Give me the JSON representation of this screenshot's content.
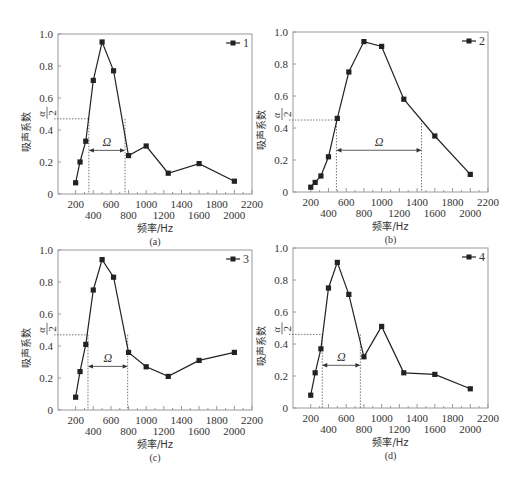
{
  "chart_data": [
    {
      "type": "line",
      "panel": "(a)",
      "legend": "1",
      "xlabel": "频率/Hz",
      "ylabel": "吸声系数",
      "xlim": [
        0,
        2200
      ],
      "ylim": [
        0,
        1.0
      ],
      "xticks_top_row": [
        "200",
        "600",
        "1000",
        "1400",
        "1800",
        "2200"
      ],
      "xticks_bottom_row": [
        "400",
        "800",
        "1200",
        "1600",
        "2000"
      ],
      "yticks": [
        "0",
        "0.2",
        "0.4",
        "0.6",
        "0.8",
        "1.0"
      ],
      "x": [
        200,
        250,
        315,
        400,
        500,
        630,
        800,
        1000,
        1250,
        1600,
        2000
      ],
      "values": [
        0.07,
        0.2,
        0.33,
        0.71,
        0.95,
        0.77,
        0.24,
        0.3,
        0.13,
        0.19,
        0.08
      ],
      "half_max_label": "α/2",
      "half_max_value": 0.47,
      "bandwidth_label": "Ω",
      "bandwidth_range": [
        350,
        760
      ],
      "grid": false,
      "legend_position": "top-right"
    },
    {
      "type": "line",
      "panel": "(b)",
      "legend": "2",
      "xlabel": "频率/Hz",
      "ylabel": "吸声系数",
      "xlim": [
        0,
        2200
      ],
      "ylim": [
        0,
        1.0
      ],
      "xticks_top_row": [
        "200",
        "600",
        "1000",
        "1400",
        "1800",
        "2200"
      ],
      "xticks_bottom_row": [
        "400",
        "800",
        "1200",
        "1600",
        "2000"
      ],
      "yticks": [
        "0",
        "0.2",
        "0.4",
        "0.6",
        "0.8",
        "1.0"
      ],
      "x": [
        200,
        250,
        315,
        400,
        500,
        630,
        800,
        1000,
        1250,
        1600,
        2000
      ],
      "values": [
        0.03,
        0.06,
        0.1,
        0.22,
        0.46,
        0.75,
        0.94,
        0.91,
        0.58,
        0.35,
        0.11
      ],
      "half_max_label": "α/2",
      "half_max_value": 0.45,
      "bandwidth_label": "Ω",
      "bandwidth_range": [
        490,
        1450
      ],
      "grid": false,
      "legend_position": "top-right"
    },
    {
      "type": "line",
      "panel": "(c)",
      "legend": "3",
      "xlabel": "频率/Hz",
      "ylabel": "吸声系数",
      "xlim": [
        0,
        2200
      ],
      "ylim": [
        0,
        1.0
      ],
      "xticks_top_row": [
        "200",
        "600",
        "1000",
        "1400",
        "1800",
        "2200"
      ],
      "xticks_bottom_row": [
        "400",
        "800",
        "1200",
        "1600",
        "2000"
      ],
      "yticks": [
        "0",
        "0.2",
        "0.4",
        "0.6",
        "0.8",
        "1.0"
      ],
      "x": [
        200,
        250,
        315,
        400,
        500,
        630,
        800,
        1000,
        1250,
        1600,
        2000
      ],
      "values": [
        0.08,
        0.24,
        0.41,
        0.75,
        0.94,
        0.83,
        0.36,
        0.27,
        0.21,
        0.31,
        0.36
      ],
      "half_max_label": "α/2",
      "half_max_value": 0.47,
      "bandwidth_label": "Ω",
      "bandwidth_range": [
        340,
        790
      ],
      "grid": false,
      "legend_position": "top-right"
    },
    {
      "type": "line",
      "panel": "(d)",
      "legend": "4",
      "xlabel": "频率/Hz",
      "ylabel": "吸声系数",
      "xlim": [
        0,
        2200
      ],
      "ylim": [
        0,
        1.0
      ],
      "xticks_top_row": [
        "200",
        "600",
        "1000",
        "1400",
        "1800",
        "2200"
      ],
      "xticks_bottom_row": [
        "400",
        "800",
        "1200",
        "1600",
        "2000"
      ],
      "yticks": [
        "0",
        "0.2",
        "0.4",
        "0.6",
        "0.8",
        "1.0"
      ],
      "x": [
        200,
        250,
        315,
        400,
        500,
        630,
        800,
        1000,
        1250,
        1600,
        2000
      ],
      "values": [
        0.08,
        0.22,
        0.37,
        0.75,
        0.91,
        0.71,
        0.32,
        0.51,
        0.22,
        0.21,
        0.12
      ],
      "half_max_label": "α/2",
      "half_max_value": 0.46,
      "bandwidth_label": "Ω",
      "bandwidth_range": [
        330,
        760
      ],
      "grid": false,
      "legend_position": "top-right"
    }
  ],
  "layout": {
    "panels": [
      {
        "left": 58,
        "right": 252,
        "top": 34,
        "bottom": 194
      },
      {
        "left": 293,
        "right": 488,
        "top": 32,
        "bottom": 192
      },
      {
        "left": 58,
        "right": 252,
        "top": 250,
        "bottom": 410
      },
      {
        "left": 293,
        "right": 488,
        "top": 248,
        "bottom": 408
      }
    ],
    "line_color": "#222222",
    "dotted_color": "#555555",
    "frame_color": "#999999"
  }
}
